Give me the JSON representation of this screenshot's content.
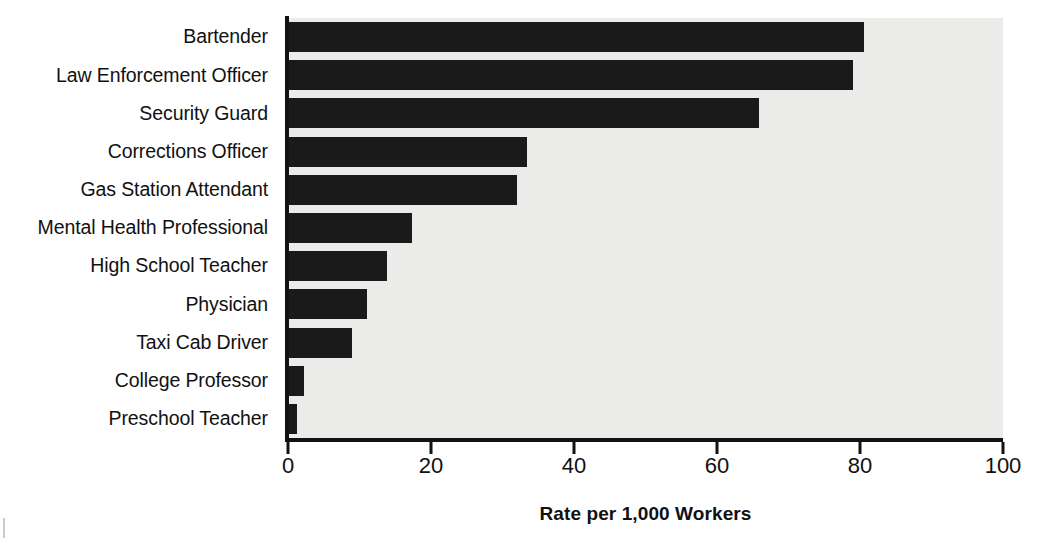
{
  "chart_data": {
    "type": "bar",
    "orientation": "horizontal",
    "title": "",
    "xlabel": "Rate per 1,000 Workers",
    "ylabel": "",
    "xlim": [
      0,
      100
    ],
    "xticks": [
      0,
      20,
      40,
      60,
      80,
      100
    ],
    "xtick_labels": [
      "0",
      "20",
      "40",
      "60",
      "80",
      "100"
    ],
    "grid": false,
    "legend": false,
    "bar_color": "#1a1a1a",
    "plot_background": "#ebebe9",
    "categories": [
      "Bartender",
      "Law Enforcement Officer",
      "Security Guard",
      "Corrections Officer",
      "Gas Station Attendant",
      "Mental Health Professional",
      "High School Teacher",
      "Physician",
      "Taxi Cab Driver",
      "College Professor",
      "Preschool Teacher"
    ],
    "values": [
      80.6,
      79.0,
      65.9,
      33.4,
      32.0,
      17.3,
      13.9,
      11.0,
      9.0,
      2.2,
      1.3
    ]
  }
}
